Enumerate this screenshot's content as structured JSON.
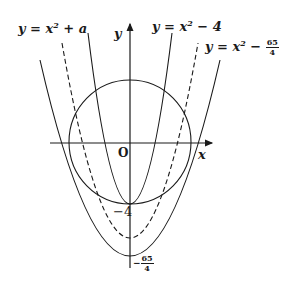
{
  "diagram": {
    "axes": {
      "x_label": "x",
      "y_label": "y",
      "origin_label": "O"
    },
    "curves": [
      {
        "id": "p1",
        "label": "y = x² + a",
        "label_parts": {
          "lhs": "y = x",
          "exp": "2",
          "rhs": " + a"
        },
        "style": "solid"
      },
      {
        "id": "p2",
        "label": "y = x² − 4",
        "label_parts": {
          "lhs": "y = x",
          "exp": "2",
          "rhs": " − 4"
        },
        "style": "solid"
      },
      {
        "id": "p3",
        "label": "y = x² − 65/4",
        "label_parts": {
          "lhs": "y = x",
          "exp": "2",
          "rhs": " − ",
          "num": "65",
          "den": "4"
        },
        "style": "solid"
      },
      {
        "id": "p4",
        "label": "dashed parabola",
        "style": "dashed"
      },
      {
        "id": "circle",
        "label": "circle centered at origin",
        "style": "solid"
      }
    ],
    "tick_labels": {
      "minus_four": "−4",
      "minus_65_over_4": {
        "sign": "−",
        "num": "65",
        "den": "4"
      }
    },
    "colors": {
      "stroke": "#1a1a1a",
      "background": "#ffffff"
    }
  }
}
